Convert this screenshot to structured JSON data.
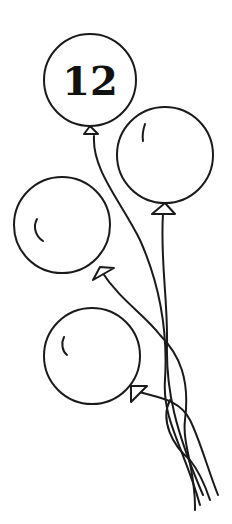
{
  "illustration": {
    "subject": "bunch of balloons",
    "balloon_count": 4,
    "label_number": "12",
    "colors": {
      "line": "#1a1a1a",
      "background": "#ffffff"
    }
  }
}
